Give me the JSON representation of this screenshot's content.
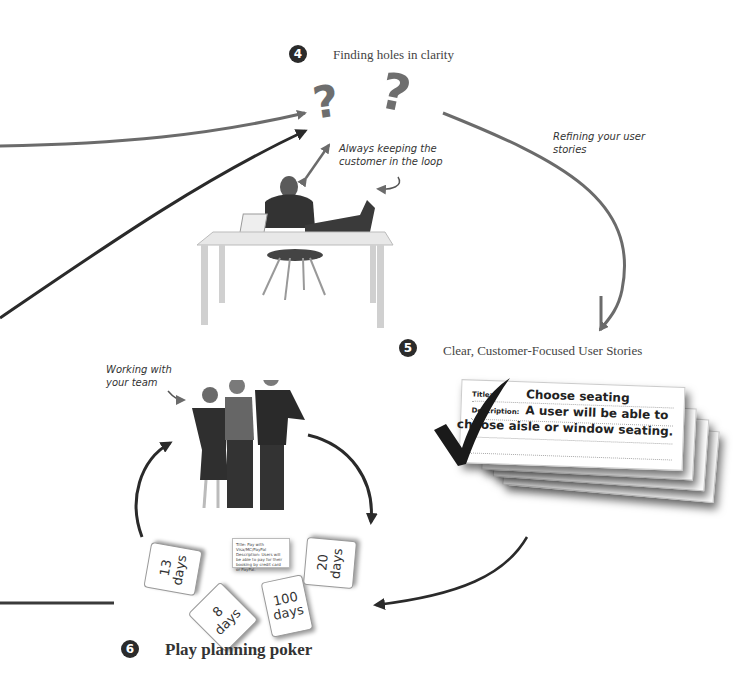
{
  "steps": {
    "step4": {
      "number": "4",
      "label": "Finding holes in clarity"
    },
    "step5": {
      "number": "5",
      "label": "Clear, Customer-Focused User Stories"
    },
    "step6": {
      "number": "6",
      "label": "Play planning poker"
    }
  },
  "annotations": {
    "customer_loop_line1": "Always keeping the",
    "customer_loop_line2": "customer in the loop",
    "refining_line1": "Refining your user",
    "refining_line2": "stories",
    "team_line1": "Working with",
    "team_line2": "your team"
  },
  "question_marks": [
    "?",
    "?"
  ],
  "story_card": {
    "title_label": "Title:",
    "title_value": "Choose seating",
    "description_label": "Description:",
    "description_line1": "A user will be able to",
    "description_line2": "choose aisle or window seating."
  },
  "poker_cards": [
    {
      "value": "13",
      "unit": "days"
    },
    {
      "value": "8",
      "unit": "days"
    },
    {
      "value": "100",
      "unit": "days"
    },
    {
      "value": "20",
      "unit": "days"
    }
  ],
  "mini_card": {
    "text": "Title: Pay with Visa/MC/PayPal Description: Users will be able to pay for their booking by credit card or PayPal."
  },
  "colors": {
    "arrow_gray": "#6b6b6b",
    "arrow_dark": "#2a2a2a",
    "badge": "#2b2b2b"
  }
}
